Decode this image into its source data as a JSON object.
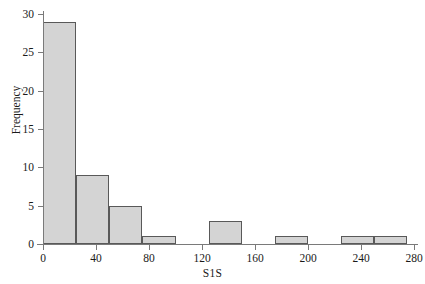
{
  "chart_data": {
    "type": "bar",
    "title": "",
    "subtitle": "",
    "xlabel": "S1S",
    "ylabel": "Frequency",
    "xlim": [
      0,
      280
    ],
    "ylim": [
      0,
      30
    ],
    "grid": false,
    "legend": null,
    "bin_width": 25,
    "bar_fill_color": "#d4d4d4",
    "bar_edge_color": "#595959",
    "axis_color": "#7a7a7a",
    "xticks": [
      0,
      40,
      80,
      120,
      160,
      200,
      240,
      280
    ],
    "xtick_labels": [
      "0",
      "40",
      "80",
      "120",
      "160",
      "200",
      "240",
      "280"
    ],
    "yticks": [
      0,
      5,
      10,
      15,
      20,
      25,
      30
    ],
    "ytick_labels": [
      "0",
      "5",
      "10",
      "15",
      "20",
      "25",
      "30"
    ],
    "bins": [
      {
        "x0": 0,
        "x1": 25,
        "value": 29
      },
      {
        "x0": 25,
        "x1": 50,
        "value": 9
      },
      {
        "x0": 50,
        "x1": 75,
        "value": 5
      },
      {
        "x0": 75,
        "x1": 100,
        "value": 1
      },
      {
        "x0": 100,
        "x1": 125,
        "value": 0
      },
      {
        "x0": 125,
        "x1": 150,
        "value": 3
      },
      {
        "x0": 150,
        "x1": 175,
        "value": 0
      },
      {
        "x0": 175,
        "x1": 200,
        "value": 1
      },
      {
        "x0": 200,
        "x1": 225,
        "value": 0
      },
      {
        "x0": 225,
        "x1": 250,
        "value": 1
      },
      {
        "x0": 250,
        "x1": 275,
        "value": 1
      }
    ],
    "categories": [
      "0-25",
      "25-50",
      "50-75",
      "75-100",
      "100-125",
      "125-150",
      "150-175",
      "175-200",
      "200-225",
      "225-250",
      "250-275"
    ],
    "values": [
      29,
      9,
      5,
      1,
      0,
      3,
      0,
      1,
      0,
      1,
      1
    ]
  }
}
